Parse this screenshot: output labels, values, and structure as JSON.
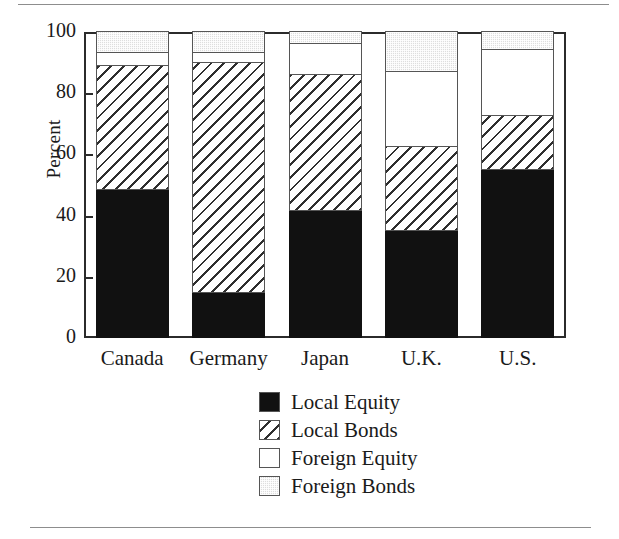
{
  "chart_data": {
    "type": "bar",
    "subtype": "stacked-bar",
    "title": "",
    "xlabel": "",
    "ylabel": "Percent",
    "ylim": [
      0,
      100
    ],
    "yticks": [
      0,
      20,
      40,
      60,
      80,
      100
    ],
    "ytick_labels": [
      "0",
      "20",
      "40",
      "60",
      "80",
      "100"
    ],
    "grid": false,
    "legend_position": "bottom-center",
    "categories": [
      "Canada",
      "Germany",
      "Japan",
      "U.K.",
      "U.S."
    ],
    "series": [
      {
        "name": "Local Equity",
        "color": "#111111",
        "pattern": "solid-black",
        "values": [
          48.5,
          14.7,
          41.5,
          35.0,
          55.0
        ]
      },
      {
        "name": "Local Bonds",
        "color": "#ffffff",
        "pattern": "diagonal-hatch",
        "values": [
          40.5,
          75.3,
          44.5,
          27.5,
          17.5
        ]
      },
      {
        "name": "Foreign Equity",
        "color": "#ffffff",
        "pattern": "empty",
        "values": [
          4.0,
          3.0,
          10.0,
          24.5,
          21.5
        ]
      },
      {
        "name": "Foreign Bonds",
        "color": "#dedede",
        "pattern": "light-stipple",
        "values": [
          7.0,
          7.0,
          4.0,
          13.0,
          6.0
        ]
      }
    ],
    "cumulative_tops": {
      "Canada": [
        48.5,
        89.0,
        93.0,
        100.0
      ],
      "Germany": [
        14.7,
        90.0,
        93.0,
        100.0
      ],
      "Japan": [
        41.5,
        86.0,
        96.0,
        100.0
      ],
      "U.K.": [
        35.0,
        62.5,
        87.0,
        100.0
      ],
      "U.S.": [
        55.0,
        72.5,
        94.0,
        100.0
      ]
    }
  },
  "axis": {
    "y_title": "Percent"
  },
  "legend": {
    "items": [
      {
        "label": "Local Equity"
      },
      {
        "label": "Local Bonds"
      },
      {
        "label": "Foreign Equity"
      },
      {
        "label": "Foreign Bonds"
      }
    ]
  }
}
